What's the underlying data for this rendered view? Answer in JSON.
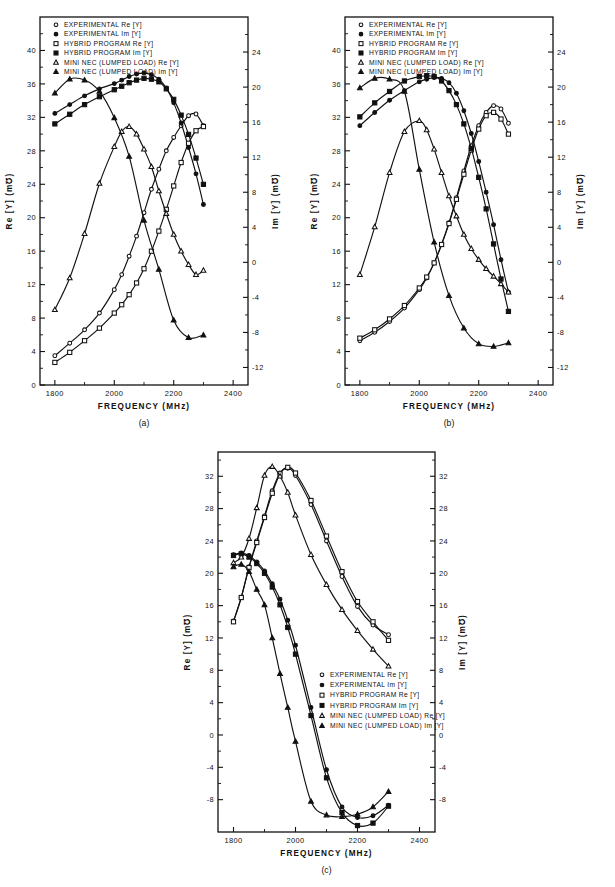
{
  "figure": {
    "panels": [
      {
        "id": "a",
        "caption": "(a)"
      },
      {
        "id": "b",
        "caption": "(b)"
      },
      {
        "id": "c",
        "caption": "(c)"
      }
    ]
  },
  "axes": {
    "xlabel": "FREQUENCY  (MHz)",
    "ylabel_left": "Re [Y]  (m℧)",
    "ylabel_right": "Im [Y]  (m℧)",
    "x_ticks": [
      "1800",
      "2000",
      "2200",
      "2400"
    ],
    "x_tick_values": [
      1800,
      2000,
      2200,
      2400
    ],
    "xlim": [
      1750,
      2450
    ],
    "ab_left_ticks": [
      "0",
      "4",
      "8",
      "12",
      "16",
      "20",
      "24",
      "28",
      "32",
      "36",
      "40"
    ],
    "ab_left_values": [
      0,
      4,
      8,
      12,
      16,
      20,
      24,
      28,
      32,
      36,
      40
    ],
    "ab_left_lim": [
      0,
      44
    ],
    "ab_right_ticks": [
      "-12",
      "-8",
      "-4",
      "0",
      "4",
      "8",
      "12",
      "16",
      "20",
      "24"
    ],
    "ab_right_values": [
      -12,
      -8,
      -4,
      0,
      4,
      8,
      12,
      16,
      20,
      24
    ],
    "ab_right_lim": [
      -14,
      28
    ],
    "c_left_ticks": [
      "-8",
      "-4",
      "0",
      "4",
      "8",
      "12",
      "16",
      "20",
      "24",
      "28",
      "32"
    ],
    "c_left_values": [
      -8,
      -4,
      0,
      4,
      8,
      12,
      16,
      20,
      24,
      28,
      32
    ],
    "c_left_lim": [
      -12,
      35
    ],
    "c_right_ticks": [
      "-8",
      "-4",
      "0",
      "4",
      "8",
      "12",
      "16",
      "20",
      "24",
      "28",
      "32"
    ],
    "c_right_values": [
      -8,
      -4,
      0,
      4,
      8,
      12,
      16,
      20,
      24,
      28,
      32
    ],
    "c_right_lim": [
      -12,
      35
    ]
  },
  "legend": {
    "entries": [
      {
        "marker": "circle-open",
        "label": "EXPERIMENTAL  Re [Y]"
      },
      {
        "marker": "circle-filled",
        "label": "EXPERIMENTAL  Im [Y]"
      },
      {
        "marker": "square-open",
        "label": "HYBRID  PROGRAM   Re [Y]"
      },
      {
        "marker": "square-filled",
        "label": "HYBRID  PROGRAM   Im [Y]"
      },
      {
        "marker": "triangle-open",
        "label": "MINI NEC (LUMPED LOAD) Re [Y]"
      },
      {
        "marker": "triangle-filled",
        "label": "MINI NEC (LUMPED LOAD) Im [Y]"
      }
    ]
  },
  "chart_data": [
    {
      "type": "line",
      "panel": "a",
      "title": "",
      "xlabel": "FREQUENCY (MHz)",
      "ylabel": "Re [Y] (m℧)",
      "ylabel2": "Im [Y] (m℧)",
      "xlim": [
        1750,
        2450
      ],
      "ylim": [
        0,
        44
      ],
      "ylim2": [
        -14,
        28
      ],
      "grid": false,
      "legend_position": "top-left-inside",
      "series": [
        {
          "name": "EXPERIMENTAL Re [Y]",
          "axis": "left",
          "marker": "circle-open",
          "x": [
            1800,
            1850,
            1900,
            1950,
            2000,
            2025,
            2050,
            2075,
            2100,
            2125,
            2150,
            2175,
            2200,
            2225,
            2250,
            2275,
            2300
          ],
          "y": [
            3.5,
            5.0,
            6.6,
            8.6,
            11.4,
            13.2,
            15.4,
            17.8,
            20.6,
            23.4,
            25.8,
            28.0,
            29.6,
            31.0,
            32.2,
            32.4,
            31.0
          ]
        },
        {
          "name": "EXPERIMENTAL Im [Y]",
          "axis": "right",
          "marker": "circle-filled",
          "x": [
            1800,
            1850,
            1900,
            1950,
            2000,
            2025,
            2050,
            2075,
            2100,
            2125,
            2150,
            2175,
            2200,
            2225,
            2250,
            2275,
            2300
          ],
          "y": [
            17.0,
            18.0,
            19.0,
            19.8,
            20.4,
            20.8,
            21.2,
            21.5,
            21.6,
            21.4,
            20.9,
            19.9,
            18.2,
            15.9,
            13.1,
            10.1,
            6.6
          ]
        },
        {
          "name": "HYBRID PROGRAM Re [Y]",
          "axis": "left",
          "marker": "square-open",
          "x": [
            1800,
            1850,
            1900,
            1950,
            2000,
            2025,
            2050,
            2075,
            2100,
            2125,
            2150,
            2175,
            2200,
            2225,
            2250,
            2275,
            2300
          ],
          "y": [
            2.7,
            3.9,
            5.3,
            6.8,
            8.6,
            9.6,
            10.8,
            12.2,
            13.9,
            16.0,
            18.4,
            21.0,
            23.8,
            26.6,
            28.9,
            30.4,
            30.9
          ]
        },
        {
          "name": "HYBRID PROGRAM Im [Y]",
          "axis": "right",
          "marker": "square-filled",
          "x": [
            1800,
            1850,
            1900,
            1950,
            2000,
            2025,
            2050,
            2075,
            2100,
            2125,
            2150,
            2175,
            2200,
            2225,
            2250,
            2275,
            2300
          ],
          "y": [
            15.8,
            16.9,
            18.0,
            18.9,
            19.7,
            20.1,
            20.5,
            20.8,
            21.0,
            20.9,
            20.6,
            19.8,
            18.6,
            16.8,
            14.6,
            11.9,
            8.9
          ]
        },
        {
          "name": "MINI NEC (LUMPED LOAD) Re [Y]",
          "axis": "left",
          "marker": "triangle-open",
          "x": [
            1800,
            1850,
            1900,
            1950,
            2000,
            2025,
            2050,
            2075,
            2100,
            2125,
            2150,
            2175,
            2200,
            2225,
            2250,
            2275,
            2300
          ],
          "y": [
            9.0,
            12.8,
            18.1,
            24.1,
            28.5,
            30.3,
            30.9,
            30.0,
            28.2,
            26.1,
            23.2,
            20.5,
            18.0,
            16.0,
            14.4,
            13.2,
            13.7
          ]
        },
        {
          "name": "MINI NEC (LUMPED LOAD) Im [Y]",
          "axis": "right",
          "marker": "triangle-filled",
          "x": [
            1800,
            1850,
            1900,
            1950,
            2000,
            2050,
            2100,
            2150,
            2200,
            2250,
            2300
          ],
          "y": [
            19.3,
            20.9,
            20.8,
            19.5,
            16.5,
            12.1,
            4.8,
            -0.8,
            -6.6,
            -8.6,
            -8.3
          ]
        }
      ]
    },
    {
      "type": "line",
      "panel": "b",
      "title": "",
      "xlabel": "FREQUENCY (MHz)",
      "ylabel": "Re [Y] (m℧)",
      "ylabel2": "Im [Y] (m℧)",
      "xlim": [
        1750,
        2450
      ],
      "ylim": [
        0,
        44
      ],
      "ylim2": [
        -14,
        28
      ],
      "grid": false,
      "legend_position": "top-left-inside",
      "series": [
        {
          "name": "EXPERIMENTAL Re [Y]",
          "axis": "left",
          "marker": "circle-open",
          "x": [
            1800,
            1850,
            1900,
            1950,
            2000,
            2025,
            2050,
            2075,
            2100,
            2125,
            2150,
            2175,
            2200,
            2225,
            2250,
            2275,
            2300
          ],
          "y": [
            5.3,
            6.3,
            7.6,
            9.2,
            11.4,
            12.8,
            14.6,
            16.8,
            19.4,
            22.4,
            25.6,
            28.6,
            31.0,
            32.6,
            33.4,
            33.0,
            31.3
          ]
        },
        {
          "name": "EXPERIMENTAL Im [Y]",
          "axis": "right",
          "marker": "circle-filled",
          "x": [
            1800,
            1850,
            1900,
            1950,
            2000,
            2025,
            2050,
            2075,
            2100,
            2125,
            2150,
            2175,
            2200,
            2225,
            2250,
            2275,
            2300
          ],
          "y": [
            15.6,
            17.1,
            18.5,
            19.6,
            20.6,
            20.9,
            21.1,
            21.0,
            20.5,
            19.3,
            17.3,
            14.7,
            11.5,
            8.0,
            4.3,
            0.3,
            -3.4
          ]
        },
        {
          "name": "HYBRID PROGRAM Re [Y]",
          "axis": "left",
          "marker": "square-open",
          "x": [
            1800,
            1850,
            1900,
            1950,
            2000,
            2025,
            2050,
            2075,
            2100,
            2125,
            2150,
            2175,
            2200,
            2225,
            2250,
            2275,
            2300
          ],
          "y": [
            5.6,
            6.6,
            7.9,
            9.5,
            11.6,
            12.9,
            14.6,
            16.8,
            19.3,
            22.2,
            25.2,
            28.1,
            30.6,
            32.2,
            32.6,
            31.8,
            30.0
          ]
        },
        {
          "name": "HYBRID PROGRAM Im [Y]",
          "axis": "right",
          "marker": "square-filled",
          "x": [
            1800,
            1850,
            1900,
            1950,
            2000,
            2025,
            2050,
            2075,
            2100,
            2125,
            2150,
            2175,
            2200,
            2225,
            2250,
            2275,
            2300
          ],
          "y": [
            16.6,
            18.2,
            19.5,
            20.7,
            21.2,
            21.3,
            21.2,
            20.7,
            19.6,
            18.0,
            15.8,
            13.0,
            9.7,
            6.1,
            2.1,
            -1.9,
            -5.6
          ]
        },
        {
          "name": "MINI NEC (LUMPED LOAD) Re [Y]",
          "axis": "left",
          "marker": "triangle-open",
          "x": [
            1800,
            1850,
            1900,
            1950,
            2000,
            2025,
            2050,
            2075,
            2100,
            2125,
            2150,
            2175,
            2200,
            2225,
            2250,
            2275,
            2300
          ],
          "y": [
            13.2,
            18.9,
            25.4,
            30.3,
            31.6,
            30.5,
            28.2,
            25.4,
            22.6,
            20.2,
            18.0,
            16.3,
            15.0,
            13.9,
            13.0,
            12.1,
            11.1
          ]
        },
        {
          "name": "MINI NEC (LUMPED LOAD) Im [Y]",
          "axis": "right",
          "marker": "triangle-filled",
          "x": [
            1800,
            1850,
            1900,
            1950,
            2000,
            2050,
            2100,
            2150,
            2200,
            2250,
            2300
          ],
          "y": [
            19.9,
            21.0,
            20.9,
            19.5,
            10.6,
            2.3,
            -3.8,
            -7.5,
            -9.3,
            -9.6,
            -9.2
          ]
        }
      ]
    },
    {
      "type": "line",
      "panel": "c",
      "title": "",
      "xlabel": "FREQUENCY (MHz)",
      "ylabel": "Re [Y] (m℧)",
      "ylabel2": "Im [Y] (m℧)",
      "xlim": [
        1750,
        2450
      ],
      "ylim": [
        -12,
        35
      ],
      "ylim2": [
        -12,
        35
      ],
      "grid": false,
      "legend_position": "center-right-inside",
      "series": [
        {
          "name": "EXPERIMENTAL Re [Y]",
          "axis": "left",
          "marker": "circle-open",
          "x": [
            1800,
            1825,
            1850,
            1875,
            1900,
            1925,
            1950,
            1975,
            2000,
            2050,
            2100,
            2150,
            2200,
            2250,
            2300
          ],
          "y": [
            14.1,
            17.0,
            20.8,
            24.0,
            27.1,
            30.2,
            32.4,
            33.0,
            32.1,
            28.5,
            24.0,
            19.6,
            15.9,
            13.6,
            12.4
          ]
        },
        {
          "name": "EXPERIMENTAL Im [Y]",
          "axis": "right",
          "marker": "circle-filled",
          "x": [
            1800,
            1825,
            1850,
            1875,
            1900,
            1925,
            1950,
            1975,
            2000,
            2050,
            2100,
            2150,
            2200,
            2250,
            2300
          ],
          "y": [
            22.3,
            22.5,
            22.2,
            21.4,
            20.3,
            18.7,
            16.8,
            14.2,
            11.1,
            3.4,
            -4.3,
            -8.9,
            -10.2,
            -10.0,
            -8.7
          ]
        },
        {
          "name": "HYBRID PROGRAM Re [Y]",
          "axis": "left",
          "marker": "square-open",
          "x": [
            1800,
            1825,
            1850,
            1875,
            1900,
            1925,
            1950,
            1975,
            2000,
            2050,
            2100,
            2150,
            2200,
            2250,
            2300
          ],
          "y": [
            14.0,
            17.0,
            20.7,
            23.8,
            26.9,
            29.9,
            32.3,
            33.1,
            32.4,
            29.0,
            24.6,
            20.2,
            16.5,
            14.0,
            11.7
          ]
        },
        {
          "name": "HYBRID PROGRAM Im [Y]",
          "axis": "right",
          "marker": "square-filled",
          "x": [
            1800,
            1825,
            1850,
            1875,
            1900,
            1925,
            1950,
            1975,
            2000,
            2050,
            2100,
            2150,
            2200,
            2250,
            2300
          ],
          "y": [
            22.2,
            22.4,
            22.0,
            21.2,
            20.0,
            18.3,
            16.1,
            13.3,
            10.0,
            2.4,
            -5.3,
            -9.6,
            -11.2,
            -10.9,
            -8.8
          ]
        },
        {
          "name": "MINI NEC (LUMPED LOAD) Re [Y]",
          "axis": "left",
          "marker": "triangle-open",
          "x": [
            1800,
            1825,
            1850,
            1875,
            1900,
            1925,
            1950,
            1975,
            2000,
            2050,
            2100,
            2150,
            2200,
            2250,
            2300
          ],
          "y": [
            21.3,
            22.0,
            24.3,
            28.1,
            32.1,
            33.2,
            32.0,
            30.0,
            27.2,
            22.3,
            18.6,
            15.5,
            12.9,
            10.6,
            8.5
          ]
        },
        {
          "name": "MINI NEC (LUMPED LOAD) Im [Y]",
          "axis": "right",
          "marker": "triangle-filled",
          "x": [
            1800,
            1825,
            1850,
            1875,
            1900,
            1925,
            1950,
            1975,
            2000,
            2050,
            2100,
            2150,
            2200,
            2250,
            2300
          ],
          "y": [
            20.8,
            21.1,
            20.2,
            18.0,
            16.1,
            12.0,
            7.6,
            3.4,
            -0.8,
            -8.2,
            -9.9,
            -10.1,
            -9.8,
            -8.9,
            -7.0
          ]
        }
      ]
    }
  ]
}
